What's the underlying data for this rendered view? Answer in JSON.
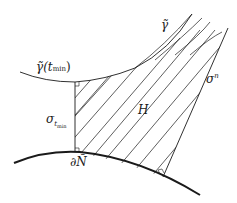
{
  "diagram": {
    "labels": {
      "gamma": "γ̃",
      "gamma_tmin_main": "γ̃(t",
      "gamma_tmin_sub": "min",
      "gamma_tmin_close": ")",
      "sigma_tmin_main": "σ",
      "sigma_tmin_sub": "t",
      "sigma_tmin_subsub": "min",
      "sigma_n_main": "σ",
      "sigma_n_sup": "n",
      "region": "H",
      "boundary": "∂Ñ"
    },
    "colors": {
      "stroke": "#1a1a1a",
      "background": "#ffffff"
    }
  }
}
